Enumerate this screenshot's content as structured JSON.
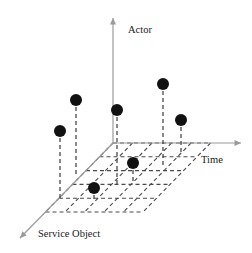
{
  "figure": {
    "background_color": "#ffffff"
  },
  "axes": {
    "vertical": {
      "name": "actor-axis",
      "label": "Actor",
      "label_x": 128,
      "label_y": 33,
      "color": "#9a9a9a",
      "from": [
        113,
        143
      ],
      "to": [
        113,
        18
      ],
      "arrow": "up"
    },
    "horizontal": {
      "name": "time-axis",
      "label": "Time",
      "label_x": 201,
      "label_y": 163,
      "color": "#9a9a9a",
      "from": [
        113,
        143
      ],
      "to": [
        241,
        143
      ],
      "arrow": "right"
    },
    "depth": {
      "name": "service-object-axis",
      "label": "Service Object",
      "label_x": 38,
      "label_y": 237,
      "color": "#9a9a9a",
      "from": [
        113,
        143
      ],
      "to": [
        20,
        238
      ],
      "arrow": "down-left"
    }
  },
  "grid_plane": {
    "name": "ground-grid-plane",
    "color": "#4a4a4a",
    "dash": "4,3",
    "origin": [
      113,
      143
    ],
    "u_step": [
      19.5,
      0
    ],
    "v_step": [
      -13.5,
      13.8
    ],
    "u_divisions": 5,
    "v_divisions": 5
  },
  "chart_data": {
    "type": "scatter",
    "title": "",
    "xlabel": "Time",
    "ylabel": "Actor",
    "zlabel": "Service Object",
    "grid": true,
    "legend": "none",
    "marker_color": "#111111",
    "marker_radius": 6,
    "stem_color": "#3a3a3a",
    "stem_dash": "4,3",
    "points": [
      {
        "id": "p1",
        "dot": [
          60,
          131
        ],
        "base": [
          60,
          198
        ],
        "has_stem": true
      },
      {
        "id": "p2",
        "dot": [
          76,
          100
        ],
        "base": [
          76,
          176
        ],
        "has_stem": true
      },
      {
        "id": "p3",
        "dot": [
          117,
          110
        ],
        "base": [
          117,
          185
        ],
        "has_stem": true
      },
      {
        "id": "p4",
        "dot": [
          163,
          84
        ],
        "base": [
          163,
          166
        ],
        "has_stem": true
      },
      {
        "id": "p5",
        "dot": [
          181,
          120
        ],
        "base": [
          181,
          152
        ],
        "has_stem": true
      },
      {
        "id": "p6",
        "dot": [
          133,
          163
        ],
        "base": [
          133,
          184
        ],
        "has_stem": true
      },
      {
        "id": "p7",
        "dot": [
          94,
          188
        ],
        "base": [
          94,
          200
        ],
        "has_stem": true
      }
    ]
  }
}
